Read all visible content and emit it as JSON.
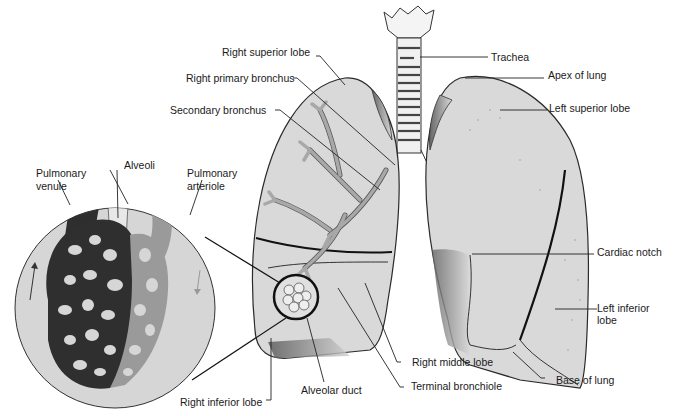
{
  "diagram": {
    "labels": {
      "right_superior_lobe": "Right superior lobe",
      "right_primary_bronchus": "Right primary bronchus",
      "secondary_bronchus": "Secondary bronchus",
      "trachea": "Trachea",
      "apex_of_lung": "Apex of lung",
      "left_superior_lobe": "Left superior lobe",
      "cardiac_notch": "Cardiac notch",
      "left_inferior_lobe_1": "Left inferior",
      "left_inferior_lobe_2": "lobe",
      "base_of_lung": "Base of lung",
      "right_middle_lobe": "Right middle lobe",
      "terminal_bronchiole": "Terminal bronchiole",
      "alveolar_duct": "Alveolar duct",
      "right_inferior_lobe": "Right inferior lobe",
      "pulmonary_venule_1": "Pulmonary",
      "pulmonary_venule_2": "venule",
      "alveoli": "Alveoli",
      "pulmonary_arteriole_1": "Pulmonary",
      "pulmonary_arteriole_2": "arteriole"
    },
    "colors": {
      "lung_fill": "#d8d8d8",
      "lung_stroke": "#2a2a2a",
      "bronchus_fill": "#a8a8a8",
      "venule_dark": "#2e2e2e",
      "arteriole_mid": "#9a9a9a",
      "inset_bg": "#d4d4d4",
      "leader_line": "#222222"
    }
  }
}
